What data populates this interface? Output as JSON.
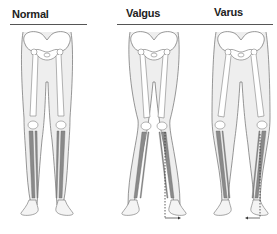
{
  "diagram": {
    "panels": [
      {
        "id": "normal",
        "label": "Normal"
      },
      {
        "id": "valgus",
        "label": "Valgus"
      },
      {
        "id": "varus",
        "label": "Varus"
      }
    ],
    "colors": {
      "outline": "#6b6b6b",
      "skin_fill": "#eeeeee",
      "bone_fill": "#ffffff",
      "bone_shade": "#8a8a8a",
      "axis_line": "#333333",
      "rule": "#555555"
    }
  }
}
